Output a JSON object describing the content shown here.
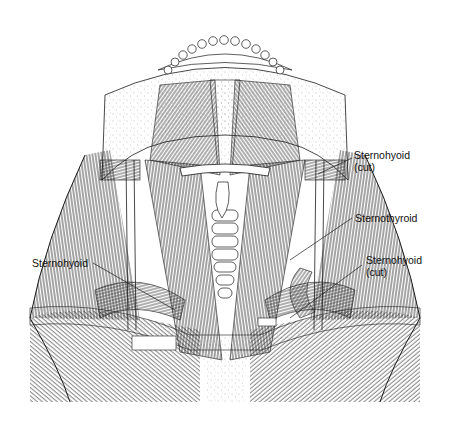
{
  "figure": {
    "colors": {
      "ink": "#1a1a1a",
      "background": "#ffffff",
      "stipple": "#888888"
    }
  },
  "labels": [
    {
      "id": "sternohyoid-cut-upper",
      "line1": "Sternohyoid",
      "line2": "(cut)"
    },
    {
      "id": "sternothyroid",
      "line1": "Sternothyroid"
    },
    {
      "id": "sternohyoid-left",
      "line1": "Sternohyoid"
    },
    {
      "id": "sternohyoid-cut-lower",
      "line1": "Sternohyoid",
      "line2": "(cut)"
    }
  ]
}
